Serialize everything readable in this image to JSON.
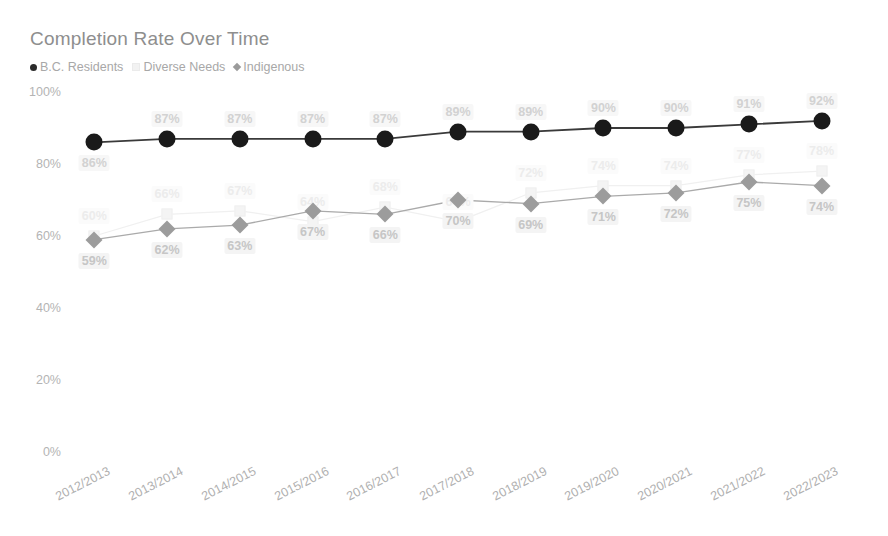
{
  "chart_data": {
    "type": "line",
    "title": "Completion Rate Over Time",
    "xlabel": "",
    "ylabel": "",
    "ylim": [
      0,
      100
    ],
    "ytick_labels": [
      "100%",
      "80%",
      "60%",
      "40%",
      "20%",
      "0%"
    ],
    "ytick_values": [
      100,
      80,
      60,
      40,
      20,
      0
    ],
    "grid": false,
    "legend_position": "top-left",
    "categories": [
      "2012/2013",
      "2013/2014",
      "2014/2015",
      "2015/2016",
      "2016/2017",
      "2017/2018",
      "2018/2019",
      "2019/2020",
      "2020/2021",
      "2021/2022",
      "2022/2023"
    ],
    "series": [
      {
        "name": "B.C. Residents",
        "marker": "circle",
        "color": "#1a1a1a",
        "label_position": "above",
        "values": [
          86,
          87,
          87,
          87,
          87,
          89,
          89,
          90,
          90,
          91,
          92
        ],
        "value_labels": [
          "86%",
          "87%",
          "87%",
          "87%",
          "87%",
          "89%",
          "89%",
          "90%",
          "90%",
          "91%",
          "92%"
        ]
      },
      {
        "name": "Diverse Needs",
        "marker": "square",
        "color": "#ededed",
        "label_position": "above",
        "values": [
          60,
          66,
          67,
          64,
          68,
          64,
          72,
          74,
          74,
          77,
          78
        ],
        "value_labels": [
          "60%",
          "66%",
          "67%",
          "64%",
          "68%",
          "64%",
          "72%",
          "74%",
          "74%",
          "77%",
          "78%"
        ]
      },
      {
        "name": "Indigenous",
        "marker": "diamond",
        "color": "#9c9c9c",
        "label_position": "below",
        "values": [
          59,
          62,
          63,
          67,
          66,
          70,
          69,
          71,
          72,
          75,
          74
        ],
        "value_labels": [
          "59%",
          "62%",
          "63%",
          "67%",
          "66%",
          "70%",
          "69%",
          "71%",
          "72%",
          "75%",
          "74%"
        ]
      }
    ]
  }
}
